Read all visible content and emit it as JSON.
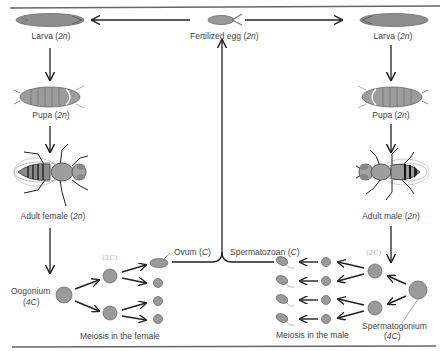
{
  "diagram": {
    "type": "life-cycle",
    "nodes": {
      "fertilized_egg": {
        "label": "Fertilized egg",
        "ploidy": "2n"
      },
      "larva_left": {
        "label": "Larva",
        "ploidy": "2n"
      },
      "larva_right": {
        "label": "Larva",
        "ploidy": "2n"
      },
      "pupa_left": {
        "label": "Pupa",
        "ploidy": "2n"
      },
      "pupa_right": {
        "label": "Pupa",
        "ploidy": "2n"
      },
      "adult_female": {
        "label": "Adult female",
        "ploidy": "2n"
      },
      "adult_male": {
        "label": "Adult male",
        "ploidy": "2n"
      },
      "oogonium": {
        "label": "Oogonium",
        "dna": "4C"
      },
      "spermatogonium": {
        "label": "Spermatogonium",
        "dna": "4C"
      },
      "ovum": {
        "label": "Ovum",
        "dna": "C"
      },
      "spermatozoan": {
        "label": "Spermatozoan",
        "dna": "C"
      }
    },
    "captions": {
      "female_meiosis": "Meiosis in the female",
      "male_meiosis": "Meiosis in the male"
    },
    "annotations": {
      "female_2c": "(2C)",
      "male_2c": "(2C)"
    },
    "edges": [
      [
        "fertilized_egg",
        "larva_left"
      ],
      [
        "fertilized_egg",
        "larva_right"
      ],
      [
        "larva_left",
        "pupa_left"
      ],
      [
        "pupa_left",
        "adult_female"
      ],
      [
        "adult_female",
        "oogonium"
      ],
      [
        "larva_right",
        "pupa_right"
      ],
      [
        "pupa_right",
        "adult_male"
      ],
      [
        "adult_male",
        "spermatogonium"
      ],
      [
        "oogonium",
        "secondary_oocytes"
      ],
      [
        "secondary_oocytes",
        "ovum"
      ],
      [
        "spermatogonium",
        "secondary_spermatocytes"
      ],
      [
        "secondary_spermatocytes",
        "spermatids"
      ],
      [
        "spermatids",
        "spermatozoan"
      ],
      [
        "ovum",
        "fertilized_egg"
      ],
      [
        "spermatozoan",
        "fertilized_egg"
      ]
    ]
  },
  "labels": {
    "fertilized_egg": "Fertilized egg (2n)",
    "larva_left": "Larva (2n)",
    "larva_right": "Larva (2n)",
    "pupa_left": "Pupa (2n)",
    "pupa_right": "Pupa (2n)",
    "adult_female": "Adult female (2n)",
    "adult_male": "Adult male (2n)",
    "oogonium_name": "Oogonium",
    "oogonium_dna": "(4C)",
    "ovum": "Ovum (C)",
    "spermatozoan": "Spermatozoan (C)",
    "spermatogonium_name": "Spermatogonium",
    "spermatogonium_dna": "(4C)",
    "female_meiosis": "Meiosis in the female",
    "male_meiosis": "Meiosis in the male",
    "female_2c": "(2C)",
    "male_2c": "(2C)"
  },
  "colors": {
    "cell_fill": "#9a9a9a",
    "cell_stroke": "#6e6e6e",
    "arrow": "#222222",
    "rule": "#555555",
    "annotation": "#b8b8b8"
  }
}
